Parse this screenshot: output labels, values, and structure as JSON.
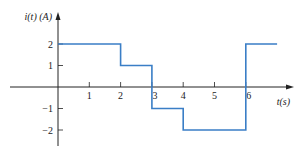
{
  "chart_data": {
    "type": "line",
    "step": true,
    "title": "",
    "xlabel": "t(s)",
    "ylabel": "i(t) (A)",
    "x_ticks": [
      "1",
      "2",
      "3",
      "4",
      "5",
      "6"
    ],
    "y_ticks": [
      "2",
      "1",
      "−1",
      "−2"
    ],
    "xlim": [
      -1.8,
      7.5
    ],
    "ylim": [
      -2.7,
      3.4
    ],
    "grid": false,
    "legend": null,
    "series": [
      {
        "name": "i(t)",
        "color": "#3a7ec6",
        "segments": [
          {
            "t_start": 0,
            "t_end": 2,
            "value": 2
          },
          {
            "t_start": 2,
            "t_end": 3,
            "value": 1
          },
          {
            "t_start": 3,
            "t_end": 4,
            "value": -1
          },
          {
            "t_start": 4,
            "t_end": 6,
            "value": -2
          },
          {
            "t_start": 6,
            "t_end": 7,
            "value": 2
          }
        ]
      }
    ]
  },
  "colors": {
    "axis": "#222222",
    "signal": "#3a7ec6"
  }
}
